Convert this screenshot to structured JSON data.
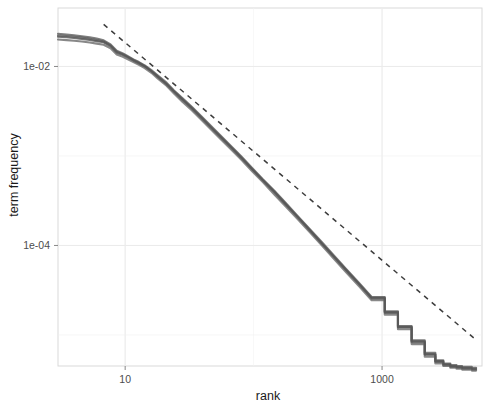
{
  "figure": {
    "width": 498,
    "height": 406,
    "background": "#ffffff",
    "panel_background": "#ffffff",
    "panel_border_color": "#d9d9d9",
    "grid_color": "#ebebeb"
  },
  "axes": {
    "x_title": "rank",
    "y_title": "term frequency",
    "x_tick_labels": [
      "10",
      "1000"
    ],
    "y_tick_labels": [
      "1e-02",
      "1e-04"
    ]
  },
  "chart_data": {
    "type": "line",
    "title": "",
    "subtitle": "",
    "xlabel": "rank",
    "ylabel": "term frequency",
    "xscale": "log",
    "yscale": "log",
    "grid": true,
    "legend": "none",
    "xlim": [
      3,
      6000
    ],
    "ylim": [
      4.5e-06,
      0.045
    ],
    "xticks": [
      10,
      1000
    ],
    "xtick_labels": [
      "10",
      "1000"
    ],
    "yticks": [
      0.01,
      0.0001
    ],
    "ytick_labels": [
      "1e-02",
      "1e-04"
    ],
    "annotations": [
      {
        "name": "zipf-reference-line",
        "style": "dashed",
        "color": "#3d3d3d",
        "description": "Zipf's law reference slope (-1) fit line",
        "x": [
          6.8,
          5200
        ],
        "y": [
          0.0295,
          9.2e-06
        ]
      }
    ],
    "series": [
      {
        "name": "corpus-1",
        "color": "#4f4f4f",
        "x": [
          3,
          3.5,
          4,
          4.6,
          5.3,
          6,
          6.8,
          7.7,
          8.6,
          9.6,
          10.5,
          11.6,
          12.8,
          14.2,
          16,
          18,
          21,
          24,
          28,
          33,
          39,
          46,
          55,
          66,
          80,
          97,
          118,
          145,
          178,
          220,
          272,
          338,
          420,
          525,
          660,
          830,
          1050,
          1330,
          1700,
          2150,
          2600,
          3000,
          3400,
          3800,
          4200,
          4600,
          5000,
          5400
        ],
        "y": [
          0.0215,
          0.0212,
          0.0208,
          0.0203,
          0.0198,
          0.0192,
          0.0186,
          0.0168,
          0.0142,
          0.0134,
          0.0126,
          0.0116,
          0.0108,
          0.01,
          0.0088,
          0.0076,
          0.0063,
          0.0052,
          0.0042,
          0.0034,
          0.00268,
          0.0021,
          0.00163,
          0.00126,
          0.00095,
          0.00071,
          0.00053,
          0.00039,
          0.000285,
          0.000206,
          0.000148,
          0.000105,
          7.45e-05,
          5.25e-05,
          3.68e-05,
          2.55e-05,
          1.76e-05,
          1.21e-05,
          8.3e-06,
          6e-06,
          5e-06,
          4.6e-06,
          4.4e-06,
          4.3e-06,
          4.2e-06,
          4.2e-06,
          4.1e-06,
          4.1e-06
        ]
      },
      {
        "name": "corpus-2",
        "color": "#5a5a5a",
        "x": [
          3,
          3.5,
          4,
          4.6,
          5.3,
          6,
          6.8,
          7.7,
          8.6,
          9.6,
          10.5,
          11.6,
          12.8,
          14.2,
          16,
          18,
          21,
          24,
          28,
          33,
          39,
          46,
          55,
          66,
          80,
          97,
          118,
          145,
          178,
          220,
          272,
          338,
          420,
          525,
          660,
          830,
          1050,
          1330,
          1700,
          2150,
          2600,
          3000,
          3400,
          3800,
          4200,
          4600,
          5000,
          5400
        ],
        "y": [
          0.0232,
          0.0228,
          0.0223,
          0.0218,
          0.0212,
          0.0205,
          0.0196,
          0.0176,
          0.015,
          0.014,
          0.013,
          0.012,
          0.0112,
          0.0103,
          0.0091,
          0.0079,
          0.0066,
          0.0054,
          0.0044,
          0.00355,
          0.0028,
          0.0022,
          0.0017,
          0.00131,
          0.00099,
          0.00074,
          0.00055,
          0.00041,
          0.000298,
          0.000214,
          0.000154,
          0.00011,
          7.8e-05,
          5.48e-05,
          3.84e-05,
          2.66e-05,
          1.84e-05,
          1.26e-05,
          8.7e-06,
          6.3e-06,
          5.2e-06,
          4.8e-06,
          4.6e-06,
          4.5e-06,
          4.4e-06,
          4.4e-06,
          4.3e-06,
          4.3e-06
        ]
      },
      {
        "name": "corpus-3",
        "color": "#666666",
        "x": [
          3,
          3.5,
          4,
          4.6,
          5.3,
          6,
          6.8,
          7.7,
          8.6,
          9.6,
          10.5,
          11.6,
          12.8,
          14.2,
          16,
          18,
          21,
          24,
          28,
          33,
          39,
          46,
          55,
          66,
          80,
          97,
          118,
          145,
          178,
          220,
          272,
          338,
          420,
          525,
          660,
          830,
          1050,
          1330,
          1700,
          2150,
          2600,
          3000,
          3400,
          3800,
          4200,
          4600,
          5000,
          5400
        ],
        "y": [
          0.02,
          0.0197,
          0.0194,
          0.019,
          0.0185,
          0.018,
          0.0175,
          0.016,
          0.0136,
          0.0128,
          0.012,
          0.0112,
          0.0104,
          0.0096,
          0.0085,
          0.0073,
          0.0061,
          0.005,
          0.004,
          0.00325,
          0.00256,
          0.00201,
          0.00156,
          0.0012,
          0.00091,
          0.00068,
          0.00051,
          0.00037,
          0.000272,
          0.000197,
          0.000142,
          0.000101,
          7.12e-05,
          5.02e-05,
          3.52e-05,
          2.44e-05,
          1.68e-05,
          1.16e-05,
          7.9e-06,
          5.7e-06,
          4.8e-06,
          4.5e-06,
          4.3e-06,
          4.2e-06,
          4.1e-06,
          4.1e-06,
          4e-06,
          4e-06
        ]
      },
      {
        "name": "corpus-4",
        "color": "#555555",
        "x": [
          3,
          3.5,
          4,
          4.6,
          5.3,
          6,
          6.8,
          7.7,
          8.6,
          9.6,
          10.5,
          11.6,
          12.8,
          14.2,
          16,
          18,
          21,
          24,
          28,
          33,
          39,
          46,
          55,
          66,
          80,
          97,
          118,
          145,
          178,
          220,
          272,
          338,
          420,
          525,
          660,
          830,
          1050,
          1330,
          1700,
          2150,
          2600,
          3000,
          3400,
          3800,
          4200,
          4600,
          5000,
          5400
        ],
        "y": [
          0.0222,
          0.0219,
          0.0215,
          0.021,
          0.0204,
          0.0197,
          0.019,
          0.0172,
          0.0146,
          0.0137,
          0.0128,
          0.0118,
          0.011,
          0.0101,
          0.0089,
          0.0077,
          0.0064,
          0.0053,
          0.0043,
          0.00346,
          0.00273,
          0.00214,
          0.00166,
          0.00128,
          0.00097,
          0.00072,
          0.00054,
          0.0004,
          0.000291,
          0.00021,
          0.000151,
          0.000107,
          7.6e-05,
          5.35e-05,
          3.75e-05,
          2.6e-05,
          1.8e-05,
          1.23e-05,
          8.5e-06,
          6.1e-06,
          5.1e-06,
          4.7e-06,
          4.5e-06,
          4.4e-06,
          4.3e-06,
          4.3e-06,
          4.2e-06,
          4.2e-06
        ]
      }
    ]
  }
}
